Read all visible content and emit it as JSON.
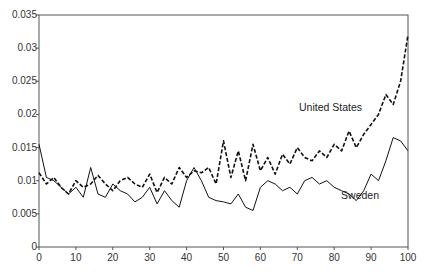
{
  "chart_data": {
    "type": "line",
    "title": "",
    "xlabel": "",
    "ylabel": "",
    "xlim": [
      0,
      100
    ],
    "ylim": [
      0,
      0.035
    ],
    "grid": false,
    "x_ticks": [
      "0",
      "10",
      "20",
      "30",
      "40",
      "50",
      "60",
      "70",
      "80",
      "90",
      "100"
    ],
    "y_ticks": [
      "0",
      "0.005",
      "0.01",
      "0.015",
      "0.02",
      "0.025",
      "0.03",
      "0.035"
    ],
    "legend": "inline labels",
    "x": [
      0,
      2,
      4,
      6,
      8,
      10,
      12,
      14,
      16,
      18,
      20,
      22,
      24,
      26,
      28,
      30,
      32,
      34,
      36,
      38,
      40,
      42,
      44,
      46,
      48,
      50,
      52,
      54,
      56,
      58,
      60,
      62,
      64,
      66,
      68,
      70,
      72,
      74,
      76,
      78,
      80,
      82,
      84,
      86,
      88,
      90,
      92,
      94,
      96,
      98,
      100
    ],
    "series": [
      {
        "name": "United States",
        "style": "dashed",
        "values": [
          0.0112,
          0.0095,
          0.0105,
          0.009,
          0.008,
          0.01,
          0.009,
          0.0095,
          0.0108,
          0.0095,
          0.0085,
          0.01,
          0.0105,
          0.0095,
          0.009,
          0.011,
          0.0082,
          0.0105,
          0.0095,
          0.012,
          0.0105,
          0.0115,
          0.0112,
          0.012,
          0.0095,
          0.016,
          0.0105,
          0.0145,
          0.01,
          0.0155,
          0.0115,
          0.0135,
          0.011,
          0.014,
          0.0125,
          0.015,
          0.0135,
          0.013,
          0.0145,
          0.0135,
          0.0155,
          0.0145,
          0.0175,
          0.015,
          0.017,
          0.0185,
          0.02,
          0.023,
          0.0215,
          0.025,
          0.032
        ]
      },
      {
        "name": "Sweden",
        "style": "solid",
        "values": [
          0.0155,
          0.0105,
          0.01,
          0.009,
          0.008,
          0.009,
          0.0075,
          0.012,
          0.008,
          0.0075,
          0.0095,
          0.0085,
          0.008,
          0.0068,
          0.0075,
          0.009,
          0.0065,
          0.0085,
          0.007,
          0.006,
          0.01,
          0.012,
          0.01,
          0.0075,
          0.007,
          0.0068,
          0.0065,
          0.008,
          0.006,
          0.0055,
          0.009,
          0.01,
          0.0095,
          0.0085,
          0.009,
          0.008,
          0.01,
          0.0105,
          0.0095,
          0.01,
          0.009,
          0.0085,
          0.008,
          0.007,
          0.0085,
          0.011,
          0.01,
          0.013,
          0.0165,
          0.016,
          0.0145
        ]
      }
    ],
    "annotations": [
      {
        "text": "United States",
        "x": 79,
        "y": 0.0205
      },
      {
        "text": "Sweden",
        "x": 87,
        "y": 0.0072
      }
    ]
  }
}
